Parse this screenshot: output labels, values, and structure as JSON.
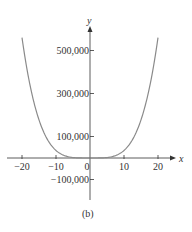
{
  "chart_data": {
    "type": "line",
    "title": "",
    "caption": "(b)",
    "xlabel": "x",
    "ylabel": "y",
    "xlim": [
      -24,
      24
    ],
    "ylim": [
      -140000,
      600000
    ],
    "x_ticks": [
      -20,
      -10,
      0,
      10,
      20
    ],
    "x_tick_labels": [
      "−20",
      "−10",
      "0",
      "10",
      "20"
    ],
    "y_ticks": [
      500000,
      300000,
      100000,
      -100000
    ],
    "y_tick_labels": [
      "500,000",
      "300,000",
      "100,000",
      "−100,000"
    ],
    "grid": false,
    "legend": null,
    "series": [
      {
        "name": "curve",
        "x": [
          -20,
          -18,
          -16,
          -14,
          -12,
          -10,
          -8,
          -6,
          -4,
          -2,
          0,
          2,
          4,
          6,
          8,
          10,
          12,
          14,
          16,
          18,
          20
        ],
        "values": [
          560000,
          367000,
          229000,
          134000,
          72600,
          35000,
          14300,
          4500,
          900,
          56,
          0,
          56,
          900,
          4500,
          14300,
          35000,
          72600,
          134000,
          229000,
          367000,
          560000
        ]
      }
    ],
    "colors": {
      "curve": "#8a8a8a",
      "axes": "#333333"
    }
  }
}
